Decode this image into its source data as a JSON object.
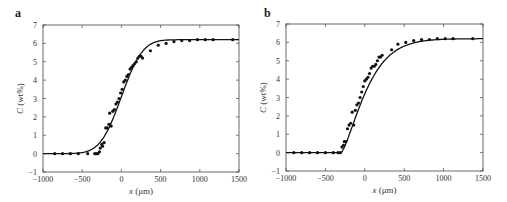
{
  "chart_data": [
    {
      "panel": "a",
      "type": "scatter",
      "title": "",
      "xlabel": "x (μm)",
      "ylabel": "C (wt%)",
      "xlim": [
        -1000,
        1500
      ],
      "ylim": [
        -1,
        7
      ],
      "xticks": [
        -1000,
        -500,
        0,
        500,
        1000,
        1500
      ],
      "yticks": [
        -1,
        0,
        1,
        2,
        3,
        4,
        5,
        6,
        7
      ],
      "grid": false,
      "series": [
        {
          "name": "measured",
          "kind": "points",
          "x": [
            -850,
            -750,
            -650,
            -550,
            -430,
            -340,
            -320,
            -300,
            -280,
            -270,
            -250,
            -240,
            -220,
            -200,
            -180,
            -160,
            -150,
            -130,
            -110,
            -90,
            -70,
            -50,
            -30,
            -10,
            10,
            30,
            50,
            70,
            90,
            110,
            130,
            150,
            170,
            190,
            210,
            230,
            250,
            270,
            370,
            470,
            570,
            670,
            770,
            870,
            970,
            1070,
            1170,
            1420
          ],
          "y": [
            0,
            0,
            0,
            0,
            0,
            0,
            0,
            0,
            0.1,
            0.3,
            0.5,
            0.4,
            0.6,
            1.4,
            1.4,
            1.6,
            2.2,
            1.5,
            2.3,
            2.4,
            2.7,
            2.8,
            3.0,
            3.3,
            3.5,
            3.9,
            4.0,
            4.2,
            4.3,
            4.6,
            4.7,
            4.8,
            4.9,
            5.0,
            5.2,
            5.3,
            5.3,
            5.2,
            5.6,
            5.9,
            6.0,
            6.1,
            6.15,
            6.15,
            6.2,
            6.2,
            6.2,
            6.2
          ]
        },
        {
          "name": "model",
          "kind": "line",
          "plateau": 6.2,
          "center": 0,
          "shape": "smooth sigmoid (erf-like)"
        }
      ]
    },
    {
      "panel": "b",
      "type": "scatter",
      "title": "",
      "xlabel": "x (μm)",
      "ylabel": "C (wt%)",
      "xlim": [
        -1000,
        1500
      ],
      "ylim": [
        -1,
        7
      ],
      "xticks": [
        -1000,
        -500,
        0,
        500,
        1000,
        1500
      ],
      "yticks": [
        -1,
        0,
        1,
        2,
        3,
        4,
        5,
        6,
        7
      ],
      "grid": false,
      "series": [
        {
          "name": "measured",
          "kind": "points",
          "x": [
            -900,
            -800,
            -700,
            -600,
            -500,
            -400,
            -340,
            -310,
            -290,
            -270,
            -260,
            -240,
            -220,
            -200,
            -180,
            -160,
            -140,
            -120,
            -100,
            -80,
            -60,
            -40,
            -20,
            0,
            20,
            40,
            60,
            80,
            100,
            120,
            140,
            160,
            180,
            200,
            220,
            340,
            420,
            520,
            620,
            720,
            820,
            920,
            1020,
            1120,
            1370
          ],
          "y": [
            0,
            0,
            0,
            0,
            0,
            0,
            0,
            0,
            0.3,
            0.4,
            0.6,
            0.6,
            1.3,
            1.5,
            1.6,
            2.2,
            1.5,
            2.3,
            2.6,
            2.7,
            3.0,
            3.3,
            3.6,
            3.9,
            4.0,
            4.1,
            4.3,
            4.6,
            4.7,
            4.7,
            4.8,
            5.0,
            5.2,
            5.2,
            5.3,
            5.6,
            5.9,
            6.0,
            6.1,
            6.15,
            6.15,
            6.2,
            6.2,
            6.2,
            6.2
          ]
        },
        {
          "name": "model",
          "kind": "line",
          "plateau": 6.2,
          "onset_x": -300,
          "shape": "sharp onset at x≈-300, then concave rise to plateau"
        }
      ]
    }
  ],
  "panels": [
    {
      "label": "a"
    },
    {
      "label": "b"
    }
  ],
  "axis_text": {
    "xlabel_italic": "x",
    "xlabel_unit": " (μm)",
    "ylabel_italic": "C",
    "ylabel_unit": " (wt%)"
  }
}
